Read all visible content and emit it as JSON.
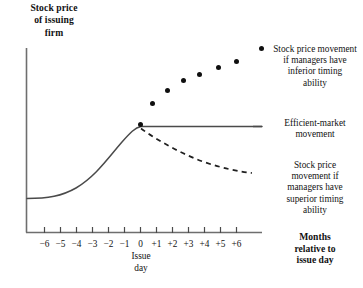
{
  "chart_data": {
    "type": "line",
    "title": "",
    "ylabel": "Stock price\nof issuing\nfirm",
    "xlabel": "Months\nrelative to\nissue day",
    "x_origin_label": "Issue\nday",
    "grid": false,
    "legend_position": "right",
    "xlim": [
      -6.6,
      6.6
    ],
    "ylim": [
      0,
      1
    ],
    "x_tick_labels": [
      "−6",
      "−5",
      "−4",
      "−3",
      "−2",
      "−1",
      "0",
      "+1",
      "+2",
      "+3",
      "+4",
      "+5",
      "+6"
    ],
    "x_tick_values": [
      -6,
      -5,
      -4,
      -3,
      -2,
      -1,
      0,
      1,
      2,
      3,
      4,
      5,
      6
    ],
    "series": [
      {
        "name": "Efficient-market movement",
        "style": "solid-line",
        "annotation": "Efficient-market\nmovement",
        "x": [
          -6,
          -5,
          -4,
          -3,
          -2,
          -1,
          0,
          1,
          2,
          3,
          4,
          5,
          6,
          7.6
        ],
        "values": [
          0.185,
          0.2,
          0.235,
          0.3,
          0.4,
          0.52,
          0.62,
          0.62,
          0.62,
          0.62,
          0.62,
          0.62,
          0.62,
          0.62
        ]
      },
      {
        "name": "Stock price movement if managers have inferior timing ability",
        "style": "dots",
        "annotation": "Stock price movement\nif managers have\ninferior timing\nability",
        "x": [
          0,
          0.75,
          1.7,
          2.7,
          3.7,
          4.9,
          6.0
        ],
        "values": [
          0.62,
          0.745,
          0.815,
          0.87,
          0.905,
          0.945,
          0.97
        ]
      },
      {
        "name": "Stock price movement if managers have superior timing ability",
        "style": "dashed-line",
        "annotation": "Stock price\nmovement if\nmanagers have\nsuperior timing\nability",
        "x": [
          0,
          1,
          2,
          3,
          4,
          5,
          6,
          7
        ],
        "values": [
          0.615,
          0.555,
          0.505,
          0.465,
          0.435,
          0.415,
          0.4,
          0.39
        ]
      }
    ]
  },
  "axes": {
    "y_title": "Stock price\nof issuing\nfirm",
    "x_title": "Months\nrelative to\nissue day",
    "origin_label": "Issue\nday"
  },
  "annotations": {
    "inferior": "Stock price movement\nif managers have\ninferior timing\nability",
    "efficient": "Efficient-market\nmovement",
    "superior": "Stock price\nmovement if\nmanagers have\nsuperior timing\nability"
  },
  "colors": {
    "line": "#2b2b2b",
    "axis": "#6e6e6e",
    "text": "#121212",
    "background": "#ffffff"
  }
}
